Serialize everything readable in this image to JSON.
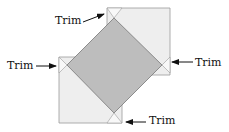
{
  "diagram": {
    "labels": {
      "top": "Trim",
      "left": "Trim",
      "right": "Trim",
      "bottom": "Trim"
    },
    "colors": {
      "background": "#ffffff",
      "light_square": "#eeeeee",
      "trim_triangle": "#f8f8f8",
      "diamond": "#bdbdbd",
      "outline": "#9a9a9a",
      "arrow": "#111111"
    }
  }
}
